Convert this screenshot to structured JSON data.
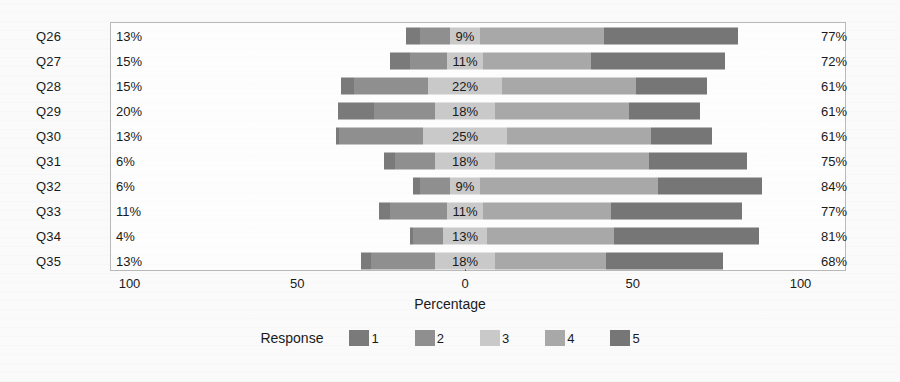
{
  "chart_data": {
    "type": "bar",
    "subtype": "diverging-stacked-likert",
    "title": "",
    "xlabel": "Percentage",
    "ylabel": "",
    "xticks": [
      "100",
      "50",
      "0",
      "50",
      "100"
    ],
    "xtick_values": [
      -100,
      -50,
      0,
      50,
      100
    ],
    "xlim": [
      -100,
      100
    ],
    "grid": false,
    "legend_position": "bottom",
    "legend_title": "Response",
    "series": [
      {
        "name": "1",
        "color": "#7a7a7a"
      },
      {
        "name": "2",
        "color": "#8f8f8f"
      },
      {
        "name": "3",
        "color": "#c9c9c9"
      },
      {
        "name": "4",
        "color": "#a8a8a8"
      },
      {
        "name": "5",
        "color": "#767676"
      }
    ],
    "categories": [
      "Q26",
      "Q27",
      "Q28",
      "Q29",
      "Q30",
      "Q31",
      "Q32",
      "Q33",
      "Q34",
      "Q35"
    ],
    "rows": [
      {
        "category": "Q26",
        "left_label": "13%",
        "mid_label": "9%",
        "right_label": "77%",
        "values": {
          "r1": 4,
          "r2": 9,
          "r3": 9,
          "r4": 37,
          "r5": 40
        }
      },
      {
        "category": "Q27",
        "left_label": "15%",
        "mid_label": "11%",
        "right_label": "72%",
        "values": {
          "r1": 6,
          "r2": 11,
          "r3": 11,
          "r4": 32,
          "r5": 40
        }
      },
      {
        "category": "Q28",
        "left_label": "15%",
        "mid_label": "22%",
        "right_label": "61%",
        "values": {
          "r1": 4,
          "r2": 22,
          "r3": 22,
          "r4": 40,
          "r5": 21
        }
      },
      {
        "category": "Q29",
        "left_label": "20%",
        "mid_label": "18%",
        "right_label": "61%",
        "values": {
          "r1": 11,
          "r2": 18,
          "r3": 18,
          "r4": 40,
          "r5": 21
        }
      },
      {
        "category": "Q30",
        "left_label": "13%",
        "mid_label": "25%",
        "right_label": "61%",
        "values": {
          "r1": 1,
          "r2": 25,
          "r3": 25,
          "r4": 43,
          "r5": 18
        }
      },
      {
        "category": "Q31",
        "left_label": "6%",
        "mid_label": "18%",
        "right_label": "75%",
        "values": {
          "r1": 3,
          "r2": 12,
          "r3": 18,
          "r4": 46,
          "r5": 29
        }
      },
      {
        "category": "Q32",
        "left_label": "6%",
        "mid_label": "9%",
        "right_label": "84%",
        "values": {
          "r1": 2,
          "r2": 9,
          "r3": 9,
          "r4": 53,
          "r5": 31
        }
      },
      {
        "category": "Q33",
        "left_label": "11%",
        "mid_label": "11%",
        "right_label": "77%",
        "values": {
          "r1": 3,
          "r2": 17,
          "r3": 11,
          "r4": 38,
          "r5": 39
        }
      },
      {
        "category": "Q34",
        "left_label": "4%",
        "mid_label": "13%",
        "right_label": "81%",
        "values": {
          "r1": 1,
          "r2": 9,
          "r3": 13,
          "r4": 38,
          "r5": 43
        }
      },
      {
        "category": "Q35",
        "left_label": "13%",
        "mid_label": "18%",
        "right_label": "68%",
        "values": {
          "r1": 3,
          "r2": 19,
          "r3": 18,
          "r4": 33,
          "r5": 35
        }
      }
    ]
  },
  "axis": {
    "title": "Percentage",
    "ticks": [
      "100",
      "50",
      "0",
      "50",
      "100"
    ]
  },
  "legend": {
    "title": "Response",
    "items": [
      {
        "key": "1",
        "color": "#7a7a7a"
      },
      {
        "key": "2",
        "color": "#8f8f8f"
      },
      {
        "key": "3",
        "color": "#c9c9c9"
      },
      {
        "key": "4",
        "color": "#a8a8a8"
      },
      {
        "key": "5",
        "color": "#767676"
      }
    ]
  }
}
